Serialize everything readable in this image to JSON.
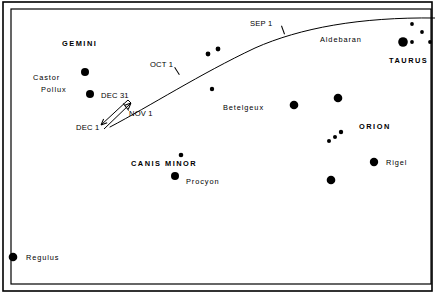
{
  "figure": {
    "kind": "star-chart",
    "background_color": "#ffffff",
    "ink_color": "#000000",
    "width": 435,
    "height": 300
  },
  "border": {
    "outer": {
      "x": 3,
      "y": 2,
      "width": 429,
      "height": 289,
      "stroke_width": 1.6
    },
    "inner": {
      "x": 11,
      "y": 9,
      "width": 420,
      "height": 275,
      "stroke_width": 1.2
    }
  },
  "chart_data": {
    "type": "scatter",
    "title": "",
    "xlabel": "",
    "ylabel": "",
    "grid": false,
    "legend": null,
    "stars": [
      {
        "name": "castor",
        "label": "Castor",
        "x": 85,
        "y": 72,
        "r": 4.0
      },
      {
        "name": "pollux",
        "label": "Pollux",
        "x": 90,
        "y": 94,
        "r": 4.0
      },
      {
        "name": "ecliptic-star-a",
        "label": "",
        "x": 208,
        "y": 54,
        "r": 2.4
      },
      {
        "name": "ecliptic-star-b",
        "label": "",
        "x": 218,
        "y": 49,
        "r": 2.4
      },
      {
        "name": "faint-star-mid",
        "label": "",
        "x": 212,
        "y": 89,
        "r": 2.2
      },
      {
        "name": "betelgeux",
        "label": "Betelgeux",
        "x": 294,
        "y": 105,
        "r": 4.3
      },
      {
        "name": "bellatrix",
        "label": "",
        "x": 338,
        "y": 98,
        "r": 4.3
      },
      {
        "name": "orion-belt-1",
        "label": "",
        "x": 329,
        "y": 141,
        "r": 2.0
      },
      {
        "name": "orion-belt-2",
        "label": "",
        "x": 335,
        "y": 137,
        "r": 2.0
      },
      {
        "name": "orion-belt-3",
        "label": "",
        "x": 341,
        "y": 132,
        "r": 2.2
      },
      {
        "name": "orion-belt-4",
        "label": "",
        "x": 331,
        "y": 180,
        "r": 4.3
      },
      {
        "name": "rigel",
        "label": "Rigel",
        "x": 374,
        "y": 162,
        "r": 4.2
      },
      {
        "name": "aldebaran",
        "label": "Aldebaran",
        "x": 403,
        "y": 42,
        "r": 4.8
      },
      {
        "name": "pleiades-1",
        "label": "",
        "x": 412,
        "y": 42,
        "r": 1.9
      },
      {
        "name": "pleiades-2",
        "label": "",
        "x": 412,
        "y": 24,
        "r": 1.9
      },
      {
        "name": "pleiades-3",
        "label": "",
        "x": 422,
        "y": 32,
        "r": 1.9
      },
      {
        "name": "pleiades-4",
        "label": "",
        "x": 430,
        "y": 42,
        "r": 1.9
      },
      {
        "name": "procyon",
        "label": "Procyon",
        "x": 175,
        "y": 176,
        "r": 4.0
      },
      {
        "name": "gomeisa",
        "label": "",
        "x": 181,
        "y": 155,
        "r": 2.3
      },
      {
        "name": "regulus",
        "label": "Regulus",
        "x": 13,
        "y": 257,
        "r": 4.3
      }
    ],
    "star_labels": [
      {
        "name": "gemini",
        "text": "GEMINI",
        "x": 62,
        "y": 40,
        "style": "constellation"
      },
      {
        "name": "castor",
        "text": "Castor",
        "x": 33,
        "y": 74,
        "style": "starname"
      },
      {
        "name": "pollux",
        "text": "Pollux",
        "x": 41,
        "y": 86,
        "style": "starname"
      },
      {
        "name": "betelgeux",
        "text": "Betelgeux",
        "x": 223,
        "y": 104,
        "style": "starname"
      },
      {
        "name": "orion",
        "text": "ORION",
        "x": 359,
        "y": 123,
        "style": "constellation"
      },
      {
        "name": "rigel",
        "text": "Rigel",
        "x": 386,
        "y": 159,
        "style": "starname"
      },
      {
        "name": "aldebaran",
        "text": "Aldebaran",
        "x": 320,
        "y": 36,
        "style": "starname"
      },
      {
        "name": "taurus",
        "text": "TAURUS",
        "x": 389,
        "y": 57,
        "style": "constellation"
      },
      {
        "name": "canis-minor",
        "text": "CANIS  MINOR",
        "x": 131,
        "y": 160,
        "style": "constellation"
      },
      {
        "name": "procyon",
        "text": "Procyon",
        "x": 186,
        "y": 178,
        "style": "starname"
      },
      {
        "name": "regulus",
        "text": "Regulus",
        "x": 26,
        "y": 254,
        "style": "starname"
      }
    ],
    "ecliptic_path": {
      "name": "planet-track",
      "description": "curved planetary track crossing the field",
      "stroke_width": 1.0,
      "d": "M 110 127 C 150 106, 200 74, 255 48 C 300 28, 360 17, 435 18"
    },
    "date_ticks": [
      {
        "name": "sep-1",
        "label": "SEP 1",
        "x": 283,
        "y": 30,
        "angle": -20,
        "label_x": 250,
        "label_y": 20
      },
      {
        "name": "oct-1",
        "label": "OCT 1",
        "x": 177,
        "y": 71,
        "angle": -32,
        "label_x": 150,
        "label_y": 61
      },
      {
        "name": "nov-1",
        "label": "NOV 1",
        "x": 126,
        "y": 107,
        "angle": -38,
        "label_x": 129,
        "label_y": 110
      },
      {
        "name": "dec-31",
        "label": "DEC 31",
        "x": 0,
        "y": 0,
        "angle": 0,
        "label_x": 101,
        "label_y": 92
      },
      {
        "name": "dec-1",
        "label": "DEC 1",
        "x": 0,
        "y": 0,
        "angle": 0,
        "label_x": 76,
        "label_y": 124
      }
    ],
    "retrograde_loop": {
      "name": "retrograde-loop",
      "description": "narrow elongated loop with arrowheads showing retrograde motion between Dec 1 and Dec 31",
      "upper_line": {
        "x1": 104,
        "y1": 129,
        "x2": 131,
        "y2": 103
      },
      "lower_line": {
        "x1": 101,
        "y1": 125,
        "x2": 128,
        "y2": 100
      },
      "arrow_dec31": {
        "x": 131,
        "y": 103
      },
      "arrow_dec1": {
        "x": 101,
        "y": 125
      }
    }
  }
}
